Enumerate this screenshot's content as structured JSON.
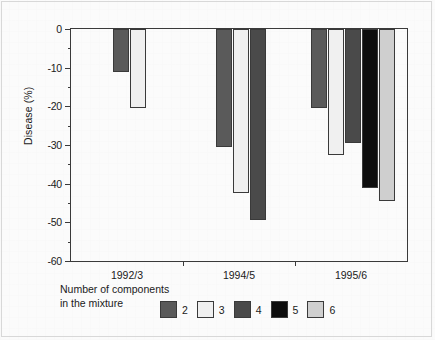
{
  "chart_data": {
    "type": "bar",
    "title": "",
    "xlabel": "",
    "ylabel": "Disease (%)",
    "ylim": [
      -60,
      0
    ],
    "ytick_step": 10,
    "ytick_labels": [
      "0",
      "-10",
      "-20",
      "-30",
      "-40",
      "-50",
      "-60"
    ],
    "ytick_values": [
      0,
      -10,
      -20,
      -30,
      -40,
      -50,
      -60
    ],
    "yminor_values": [
      -5,
      -15,
      -25,
      -35,
      -45,
      -55
    ],
    "grid": false,
    "legend_position": "bottom",
    "legend_title": "Number of components\nin the mixture",
    "categories": [
      "1992/3",
      "1994/5",
      "1995/6"
    ],
    "series": [
      {
        "name": "2",
        "color": "#5a5a5a",
        "values": [
          -11.0,
          -30.5,
          -20.5
        ]
      },
      {
        "name": "3",
        "color": "#f0f0f0",
        "values": [
          -20.5,
          -42.5,
          -32.5
        ]
      },
      {
        "name": "4",
        "color": "#4a4a4a",
        "values": [
          null,
          -49.5,
          -29.5
        ]
      },
      {
        "name": "5",
        "color": "#0d0d0d",
        "values": [
          null,
          null,
          -41.0
        ]
      },
      {
        "name": "6",
        "color": "#cfcfcf",
        "values": [
          null,
          null,
          -44.5
        ]
      }
    ]
  },
  "axis": {
    "y_title": "Disease (%)"
  },
  "legend": {
    "title_line1": "Number of components",
    "title_line2": "in the mixture",
    "items": [
      {
        "label": "2",
        "color": "#5a5a5a"
      },
      {
        "label": "3",
        "color": "#f0f0f0"
      },
      {
        "label": "4",
        "color": "#4a4a4a"
      },
      {
        "label": "5",
        "color": "#0d0d0d"
      },
      {
        "label": "6",
        "color": "#cfcfcf"
      }
    ]
  },
  "colors": {
    "axis": "#3a3a3a",
    "text": "#1a1a1a",
    "background": "#fbfbfb"
  }
}
